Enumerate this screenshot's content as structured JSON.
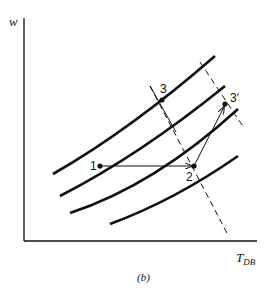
{
  "figure": {
    "caption": "(b)",
    "y_axis_label": "w",
    "x_axis_label_main": "T",
    "x_axis_label_sub": "DB"
  },
  "points": [
    {
      "id": "1",
      "label": "1"
    },
    {
      "id": "2",
      "label": "2"
    },
    {
      "id": "3",
      "label": "3"
    },
    {
      "id": "3p",
      "label": "3′"
    }
  ],
  "colors": {
    "ink": "#111111",
    "background": "#ffffff"
  }
}
